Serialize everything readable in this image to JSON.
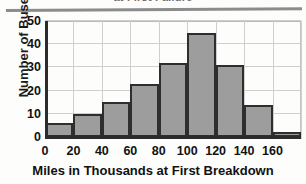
{
  "chart_data": {
    "type": "bar",
    "title": "at First Failure",
    "title_cropped": true,
    "xlabel": "Miles in Thousands at First Breakdown",
    "ylabel": "Number of Buses",
    "categories": [
      "0-20",
      "20-40",
      "40-60",
      "60-80",
      "80-100",
      "100-120",
      "120-140",
      "140-160",
      "160-180"
    ],
    "bin_edges": [
      0,
      20,
      40,
      60,
      80,
      100,
      120,
      140,
      160,
      180
    ],
    "values": [
      6,
      10,
      15,
      23,
      32,
      45,
      31,
      14,
      2
    ],
    "xlim": [
      0,
      180
    ],
    "ylim": [
      0,
      50
    ],
    "xticks": [
      "0",
      "20",
      "40",
      "60",
      "80",
      "100",
      "120",
      "140",
      "160"
    ],
    "xtick_values": [
      0,
      20,
      40,
      60,
      80,
      100,
      120,
      140,
      160
    ],
    "yticks": [
      "0",
      "10",
      "20",
      "30",
      "40",
      "50"
    ],
    "ytick_values": [
      0,
      10,
      20,
      30,
      40,
      50
    ],
    "grid": true,
    "legend": "none",
    "bar_color": "#9d9d9d",
    "bar_edge_color": "#2e2e2e",
    "grid_color": "#cfcfcf",
    "axis_color": "#2c2c2c"
  }
}
